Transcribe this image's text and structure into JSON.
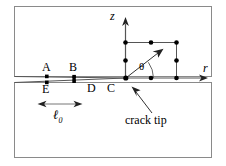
{
  "figure": {
    "type": "technical-diagram",
    "background_color": "#ffffff",
    "line_color": "#4a4a4a",
    "node_color": "#000000",
    "frame": {
      "upper_block_label": "upper-body-region",
      "lower_block_label": "lower-body-region"
    },
    "axes": [
      {
        "name": "vertical-axis",
        "label": "z",
        "direction": "up"
      },
      {
        "name": "horizontal-axis",
        "label": "r",
        "direction": "right"
      }
    ],
    "angle": {
      "label": "θ",
      "name": "theta-angle",
      "between": "r-axis and radial ray"
    },
    "points": [
      {
        "id": "A",
        "label": "A",
        "face": "upper-crack-face"
      },
      {
        "id": "B",
        "label": "B",
        "face": "upper-crack-face"
      },
      {
        "id": "C",
        "label": "C",
        "face": "crack-tip"
      },
      {
        "id": "D",
        "label": "D",
        "face": "lower-crack-face"
      },
      {
        "id": "E",
        "label": "E",
        "face": "lower-crack-face"
      }
    ],
    "annotations": [
      {
        "id": "crack-tip",
        "text": "crack tip",
        "points_to": "C"
      }
    ],
    "dimension": {
      "id": "l0",
      "symbol": "ℓ",
      "subscript": "0",
      "from": "E",
      "to": "D",
      "description": "crack face element length"
    },
    "mesh": {
      "description": "quadratic quadrilateral element ring at crack tip",
      "node_count": 13
    }
  }
}
